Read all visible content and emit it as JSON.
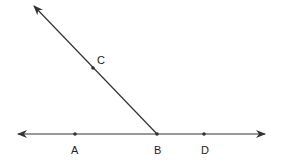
{
  "diagram": {
    "type": "geometry-lines-and-rays",
    "stroke_color": "#333333",
    "points": [
      {
        "label": "A",
        "x": 75,
        "y": 134
      },
      {
        "label": "B",
        "x": 157,
        "y": 134
      },
      {
        "label": "C",
        "x": 93,
        "y": 68
      },
      {
        "label": "D",
        "x": 204,
        "y": 134
      }
    ],
    "line": {
      "name": "line AD",
      "x1": 18,
      "y1": 134,
      "x2": 265,
      "y2": 134,
      "arrows": "both"
    },
    "ray": {
      "name": "ray BC",
      "x1": 157,
      "y1": 134,
      "x2": 34,
      "y2": 6,
      "arrows": "end"
    },
    "labels": {
      "A": "A",
      "B": "B",
      "C": "C",
      "D": "D"
    }
  }
}
